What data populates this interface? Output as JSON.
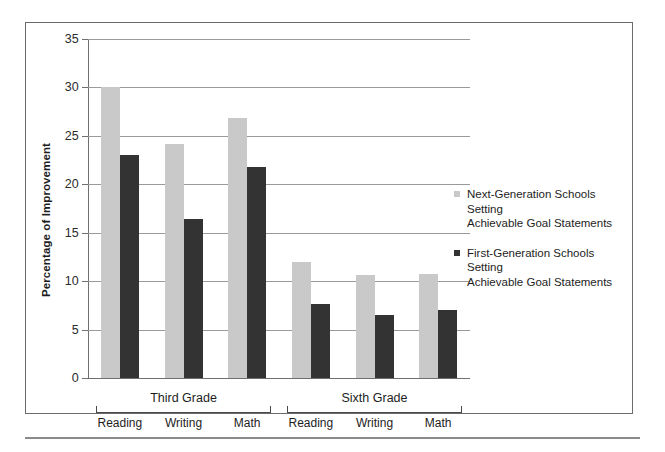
{
  "chart_data": {
    "type": "bar",
    "title": "",
    "xlabel": "",
    "ylabel": "Percentage of Improvement",
    "ylim": [
      0,
      35
    ],
    "yticks": [
      0,
      5,
      10,
      15,
      20,
      25,
      30,
      35
    ],
    "grid": true,
    "legend_position": "right",
    "groups": [
      {
        "label": "Third Grade",
        "categories": [
          "Reading",
          "Writing",
          "Math"
        ]
      },
      {
        "label": "Sixth Grade",
        "categories": [
          "Reading",
          "Writing",
          "Math"
        ]
      }
    ],
    "categories": [
      "Third Grade - Reading",
      "Third Grade - Writing",
      "Third Grade - Math",
      "Sixth Grade - Reading",
      "Sixth Grade - Writing",
      "Sixth Grade - Math"
    ],
    "series": [
      {
        "name": "Next-Generation Schools Setting Achievable Goal Statements",
        "color": "#c9c9c9",
        "values": [
          30.0,
          24.2,
          26.8,
          12.0,
          10.6,
          10.7
        ]
      },
      {
        "name": "First-Generation Schools Setting Achievable Goal Statements",
        "color": "#333333",
        "values": [
          23.0,
          16.4,
          21.8,
          7.6,
          6.5,
          7.0
        ]
      }
    ]
  },
  "legend": {
    "entries": [
      {
        "line1": "Next-Generation Schools Setting",
        "line2": "Achievable Goal Statements",
        "swatch": "light"
      },
      {
        "line1": "First-Generation Schools Setting",
        "line2": "Achievable Goal Statements",
        "swatch": "dark"
      }
    ]
  },
  "colors": {
    "light_bar": "#c9c9c9",
    "dark_bar": "#333333",
    "gridline": "#9a9a9a",
    "axis": "#6f6f6f",
    "frame": "#6b6b6b"
  }
}
